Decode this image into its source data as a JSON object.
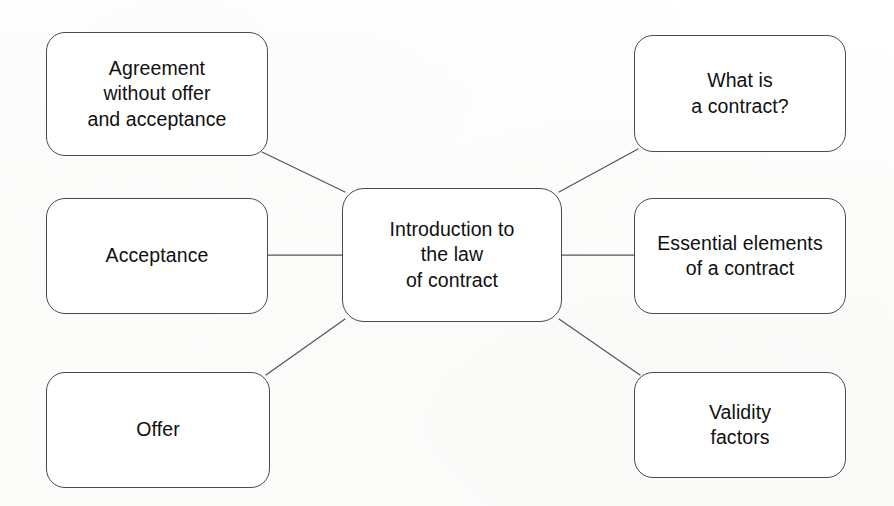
{
  "diagram": {
    "title": "Introduction to the law of contract",
    "type": "mind-map",
    "background_color": "#fdfdfc",
    "node_border_color": "#4a4a4a",
    "node_fill_color": "#ffffff",
    "connector_color": "#555555",
    "center": {
      "id": "center",
      "label": "Introduction to\nthe law\nof contract"
    },
    "branches": [
      {
        "id": "agreement",
        "label": "Agreement\nwithout offer\nand acceptance",
        "position": "top-left"
      },
      {
        "id": "acceptance",
        "label": "Acceptance",
        "position": "middle-left"
      },
      {
        "id": "offer",
        "label": "Offer",
        "position": "bottom-left"
      },
      {
        "id": "what-is-contract",
        "label": "What is\na contract?",
        "position": "top-right"
      },
      {
        "id": "essential",
        "label": "Essential elements\nof a contract",
        "position": "middle-right"
      },
      {
        "id": "validity",
        "label": "Validity\nfactors",
        "position": "bottom-right"
      }
    ],
    "connectors": [
      {
        "from": "agreement",
        "to": "center",
        "style": "diagonal"
      },
      {
        "from": "acceptance",
        "to": "center",
        "style": "horizontal"
      },
      {
        "from": "offer",
        "to": "center",
        "style": "diagonal"
      },
      {
        "from": "center",
        "to": "what-is-contract",
        "style": "diagonal"
      },
      {
        "from": "center",
        "to": "essential",
        "style": "horizontal"
      },
      {
        "from": "center",
        "to": "validity",
        "style": "diagonal"
      }
    ]
  }
}
